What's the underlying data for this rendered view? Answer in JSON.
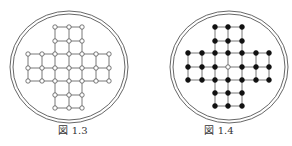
{
  "figures": [
    {
      "id": "fig13",
      "caption": "図 1.3",
      "offset_x": 0,
      "center": [
        69,
        67
      ],
      "outer_radius": [
        59,
        56
      ],
      "inner_radius": [
        56,
        53
      ],
      "grid_x": [
        28,
        42,
        55,
        69,
        82,
        96,
        109
      ],
      "grid_y": [
        27,
        41,
        54,
        68,
        81,
        95,
        108
      ],
      "node_style": "hollow",
      "empty_center": false
    },
    {
      "id": "fig14",
      "caption": "図 1.4",
      "offset_x": 146,
      "center": [
        83,
        67
      ],
      "outer_radius": [
        59,
        56
      ],
      "inner_radius": [
        56,
        53
      ],
      "grid_x": [
        42,
        56,
        69,
        82,
        96,
        110,
        123
      ],
      "grid_y": [
        27,
        41,
        53,
        67,
        80,
        93,
        106
      ],
      "node_style": "filled",
      "empty_center": true
    }
  ],
  "colors": {
    "line": "#555555",
    "node_fill_filled": "#111111",
    "node_fill_hollow": "#ffffff",
    "node_stroke": "#444444"
  }
}
